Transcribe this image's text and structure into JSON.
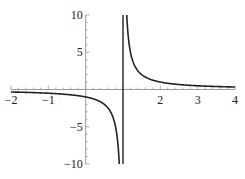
{
  "chart_data": {
    "type": "line",
    "title": "",
    "xlabel": "",
    "ylabel": "",
    "function": "y = 1/(x - 1)",
    "xlim": [
      -2,
      4
    ],
    "ylim": [
      -10,
      10
    ],
    "grid": false,
    "legend": null,
    "x_ticks": [
      -2,
      -1,
      1,
      2,
      3,
      4
    ],
    "x_tick_labels": [
      "−2",
      "−1",
      "",
      "2",
      "3",
      "4"
    ],
    "y_ticks": [
      10,
      5,
      -5,
      -10
    ],
    "y_tick_labels": [
      "10",
      "5",
      "−5",
      "−10"
    ],
    "vertical_asymptote": 1,
    "horizontal_asymptote": 0,
    "series": [
      {
        "name": "1/(x-1)",
        "color": "#222222",
        "x": [
          -2,
          -1.5,
          -1,
          -0.5,
          0,
          0.25,
          0.5,
          0.7,
          0.8,
          0.85,
          0.9,
          1.1,
          1.15,
          1.2,
          1.3,
          1.5,
          2,
          2.5,
          3,
          3.5,
          4
        ],
        "values": [
          -0.333,
          -0.4,
          -0.5,
          -0.667,
          -1,
          -1.333,
          -2,
          -3.333,
          -5,
          -6.667,
          -10,
          10,
          6.667,
          5,
          3.333,
          2,
          1,
          0.667,
          0.5,
          0.4,
          0.333
        ]
      }
    ]
  }
}
